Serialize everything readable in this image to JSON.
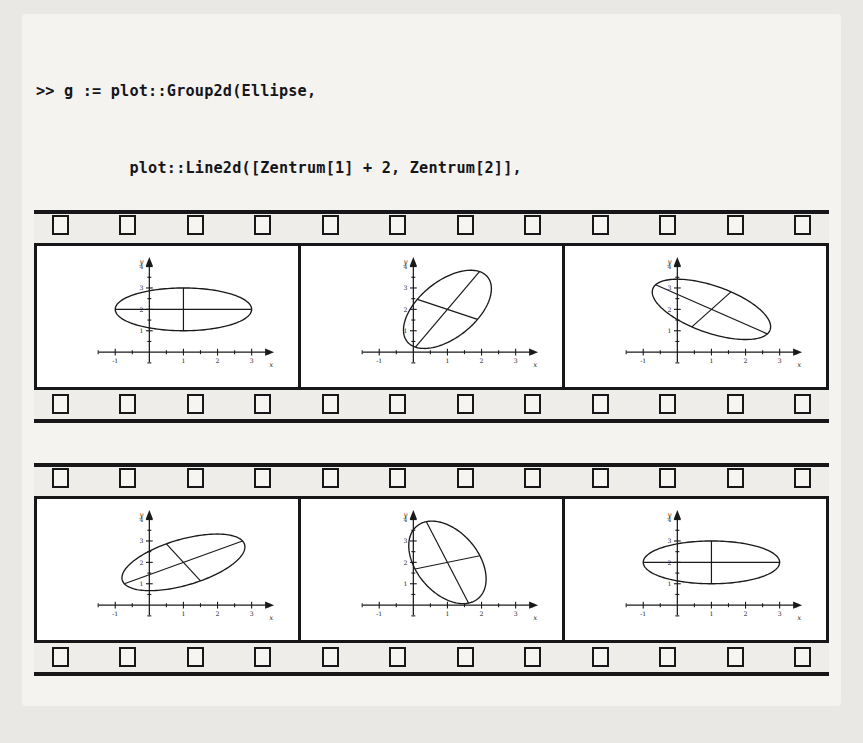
{
  "code": {
    "lines": [
      ">> g := plot::Group2d(Ellipse,",
      "          plot::Line2d([Zentrum[1] + 2, Zentrum[2]],",
      "                       [Zentrum[1] - 2, Zentrum[2]]),",
      "          plot::Line2d([Zentrum[1], Zentrum[2] + 1],",
      "                       [Zentrum[1], Zentrum[2] - 1])):",
      ">> plot(plot::Rotate2d(a, Zentrum, a = 0..2*PI, g)):"
    ]
  },
  "filmstrips": {
    "perforation_count": 12,
    "strips": [
      {
        "name": "top-strip",
        "frames": [
          {
            "name": "frame-1",
            "angle_deg": 0
          },
          {
            "name": "frame-2",
            "angle_deg": 62
          },
          {
            "name": "frame-3",
            "angle_deg": -35
          }
        ]
      },
      {
        "name": "bottom-strip",
        "frames": [
          {
            "name": "frame-4",
            "angle_deg": 30
          },
          {
            "name": "frame-5",
            "angle_deg": 108
          },
          {
            "name": "frame-6",
            "angle_deg": 0
          }
        ]
      }
    ]
  },
  "chart_data": {
    "type": "scatter",
    "title": "",
    "xlabel": "x",
    "ylabel": "y",
    "xlim": [
      -1.6,
      3.6
    ],
    "ylim": [
      -0.6,
      4.4
    ],
    "xticks": [
      -1,
      1,
      2,
      3
    ],
    "yticks": [
      1,
      2,
      3,
      4
    ],
    "xtick_labels": [
      "-1",
      "1",
      "2",
      "3"
    ],
    "ytick_labels": [
      "1",
      "2",
      "3",
      "4"
    ],
    "minor_tick_step": 0.5,
    "grid": false,
    "legend": false,
    "ellipse": {
      "center": [
        1,
        2
      ],
      "semi_major": 2,
      "semi_minor": 1,
      "stroke": "#1a1a1a"
    },
    "cross_lines": [
      {
        "name": "major-axis-line",
        "from": [
          -1,
          2
        ],
        "to": [
          3,
          2
        ]
      },
      {
        "name": "minor-axis-line",
        "from": [
          1,
          3
        ],
        "to": [
          1,
          1
        ]
      }
    ],
    "rotation_angles_deg": [
      0,
      62,
      -35,
      30,
      108,
      0
    ],
    "rotation_center": [
      1,
      2
    ],
    "parameter": "a = 0..2*PI"
  }
}
